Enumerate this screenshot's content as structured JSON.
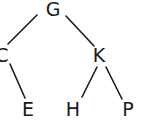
{
  "diagram": {
    "type": "binary-tree",
    "colors": {
      "background": "#ffffff",
      "stroke": "#1a1a1a",
      "text": "#1a1a1a"
    },
    "nodes": [
      {
        "id": "G",
        "label": "G",
        "x": 53,
        "y": 0
      },
      {
        "id": "C",
        "label": "C",
        "x": 2,
        "y": 46
      },
      {
        "id": "K",
        "label": "K",
        "x": 99,
        "y": 46
      },
      {
        "id": "E",
        "label": "E",
        "x": 28,
        "y": 100
      },
      {
        "id": "H",
        "label": "H",
        "x": 73,
        "y": 100
      },
      {
        "id": "P",
        "label": "P",
        "x": 128,
        "y": 100
      }
    ],
    "edges": [
      {
        "from": "G",
        "to": "C",
        "x1": 37,
        "y1": 15,
        "x2": 8,
        "y2": 44
      },
      {
        "from": "G",
        "to": "K",
        "x1": 66,
        "y1": 16,
        "x2": 94,
        "y2": 46
      },
      {
        "from": "C",
        "to": "E",
        "x1": 10,
        "y1": 64,
        "x2": 25,
        "y2": 98
      },
      {
        "from": "K",
        "to": "H",
        "x1": 97,
        "y1": 67,
        "x2": 82,
        "y2": 97
      },
      {
        "from": "K",
        "to": "P",
        "x1": 106,
        "y1": 67,
        "x2": 122,
        "y2": 99
      }
    ]
  }
}
